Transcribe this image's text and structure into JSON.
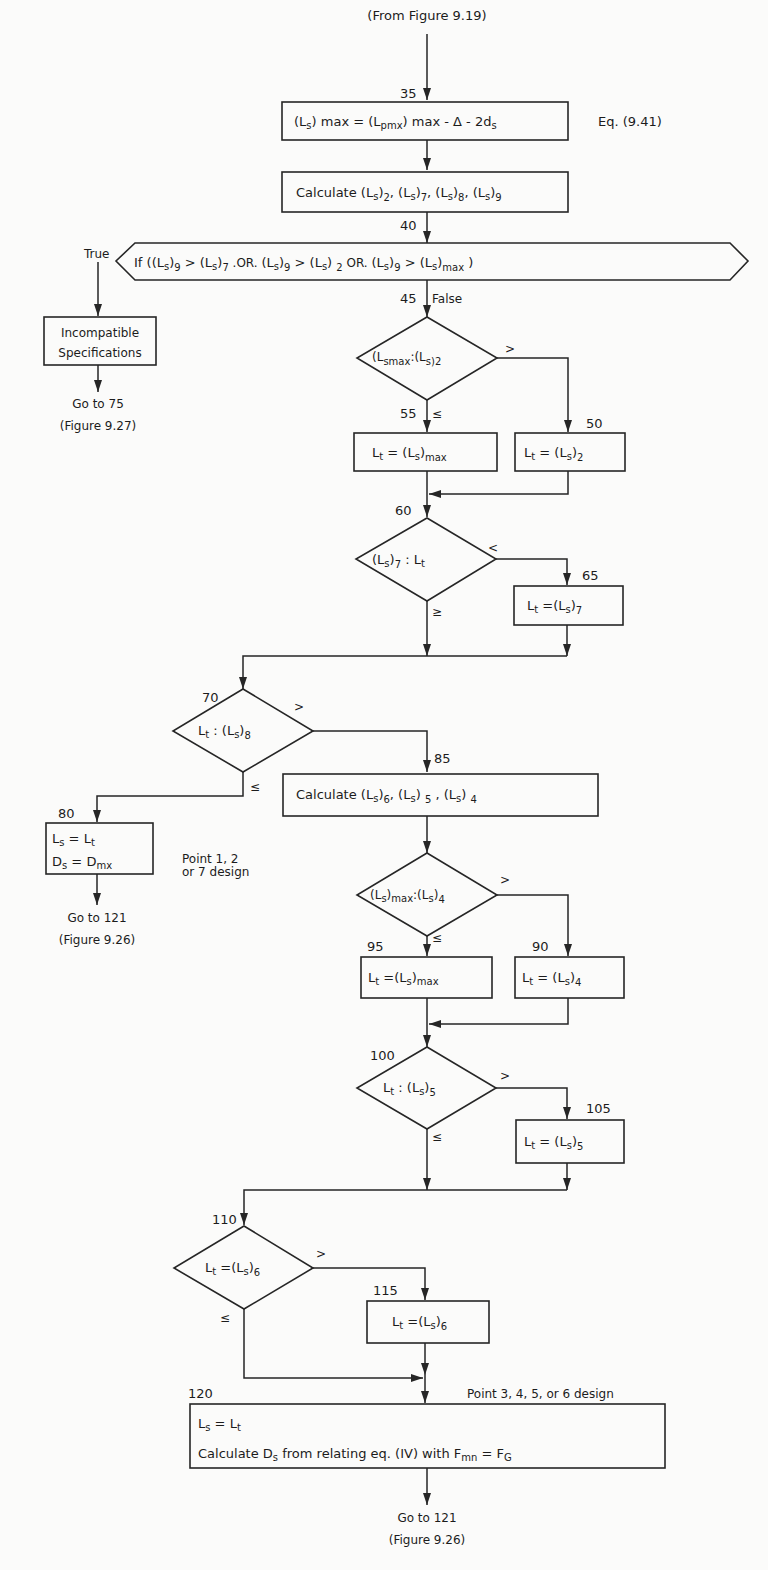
{
  "entry": {
    "label": "(From Figure 9.19)"
  },
  "nodes": {
    "n35": {
      "step": "35",
      "text": "(Lₛ) max = (L pmx) max - Δ - 2dₛ",
      "parts": {
        "a": "(L",
        "a_sub": "s",
        "b": ") max = (L",
        "b_sub": "pmx",
        "c": ") max - Δ - 2d",
        "c_sub": "s"
      },
      "ref": "Eq. (9.41)"
    },
    "calc1": {
      "text": "Calculate (Ls)2, (Ls)7, (Ls)8, (Ls)9",
      "prefix": "Calculate",
      "terms": [
        "2",
        "7",
        "8",
        "9"
      ]
    },
    "n40": {
      "step": "40",
      "text": "If ((Ls)9 > (Ls)7 .OR. (Ls)9 > (Ls)2 .OR. (Ls)9 > (Ls)max)",
      "true_label": "True",
      "prefix": "If (",
      "or1": ".OR.",
      "or2": "OR.",
      "gt": ">"
    },
    "incompatible": {
      "line1": "Incompatible",
      "line2": "Specifications",
      "goto": "Go to 75",
      "goto_ref": "(Figure 9.27)"
    },
    "n45": {
      "step": "45",
      "false_label": "False",
      "text": "(Ls)max : (Ls)2",
      "gt_label": ">",
      "le_label": "≤"
    },
    "n55": {
      "step": "55",
      "text": "Lt = (Ls)max"
    },
    "n50": {
      "step": "50",
      "text": "Lt = (Ls)2"
    },
    "n60": {
      "step": "60",
      "text": "(Ls)7 : Lt",
      "lt_label": "<",
      "ge_label": "≥"
    },
    "n65": {
      "step": "65",
      "text": "Lt = (Ls)7"
    },
    "n70": {
      "step": "70",
      "text": "Lt : (Ls)8",
      "gt_label": ">",
      "le_label": "≤"
    },
    "n80": {
      "step": "80",
      "line1": "Ls = Lt",
      "line2": "Ds = Dmx",
      "note_line1": "Point 1, 2",
      "note_line2": "or 7 design",
      "goto": "Go to 121",
      "goto_ref": "(Figure 9.26)"
    },
    "n85": {
      "step": "85",
      "text": "Calculate (Ls)6, (Ls)5, (Ls)4",
      "prefix": "Calculate",
      "terms": [
        "6",
        "5",
        "4"
      ]
    },
    "nmax4": {
      "text": "(Ls)max : (Ls)4",
      "gt_label": ">",
      "le_label": "≤"
    },
    "n95": {
      "step": "95",
      "text": "Lt = (Ls)max"
    },
    "n90": {
      "step": "90",
      "text": "Lt = (Ls)4"
    },
    "n100": {
      "step": "100",
      "text": "Lt : (Ls)5",
      "gt_label": ">",
      "le_label": "≤"
    },
    "n105": {
      "step": "105",
      "text": "Lt = (Ls)5"
    },
    "n110": {
      "step": "110",
      "text": "Lt = (Ls)6",
      "gt_label": ">",
      "le_label": "≤"
    },
    "n115": {
      "step": "115",
      "text": "Lt = (Ls)6"
    },
    "n120": {
      "step": "120",
      "note": "Point 3, 4, 5, or 6 design",
      "line1": "Ls = Lt",
      "line2": "Calculate Ds from relating eq. (IV) with Fmn = FG",
      "line2_parts": {
        "a": "Calculate D",
        "a_sub": "s",
        "b": " from relating eq. (IV) with F",
        "b_sub": "mn",
        "c": " = F",
        "c_sub": "G"
      },
      "goto": "Go to 121",
      "goto_ref": "(Figure 9.26)"
    }
  },
  "symbols": {
    "L": "L",
    "s": "s",
    "t": "t",
    "max": "max",
    "eq": "=",
    "colon": ":",
    "comma": ","
  }
}
